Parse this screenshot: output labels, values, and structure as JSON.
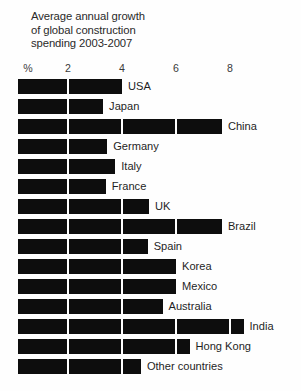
{
  "chart_data": {
    "type": "bar",
    "orientation": "horizontal",
    "title": "Average annual growth\nof global construction\nspending 2003-2007",
    "xlabel": "%",
    "ylabel": "",
    "xlim": [
      0,
      9.2
    ],
    "xticks": [
      2,
      4,
      6,
      8
    ],
    "xtick_labels": [
      "2",
      "4",
      "6",
      "8"
    ],
    "axis_unit_label": "%",
    "grid": true,
    "grid_color": "#fefefe",
    "bar_color": "#0d0d0d",
    "background_color": "#fefefe",
    "legend": "none",
    "categories": [
      "USA",
      "Japan",
      "China",
      "Germany",
      "Italy",
      "France",
      "UK",
      "Brazil",
      "Spain",
      "Korea",
      "Mexico",
      "Australia",
      "India",
      "Hong Kong",
      "Other countries"
    ],
    "values": [
      4.0,
      3.3,
      7.7,
      3.45,
      3.75,
      3.4,
      5.0,
      7.7,
      4.95,
      6.0,
      6.0,
      5.5,
      8.5,
      6.5,
      4.7
    ],
    "series": [
      {
        "name": "Average annual growth 2003-2007 (%)",
        "values": [
          4.0,
          3.3,
          7.7,
          3.45,
          3.75,
          3.4,
          5.0,
          7.7,
          4.95,
          6.0,
          6.0,
          5.5,
          8.5,
          6.5,
          4.7
        ]
      }
    ]
  },
  "title_lines": [
    "Average annual growth",
    "of global construction",
    "spending 2003-2007"
  ]
}
